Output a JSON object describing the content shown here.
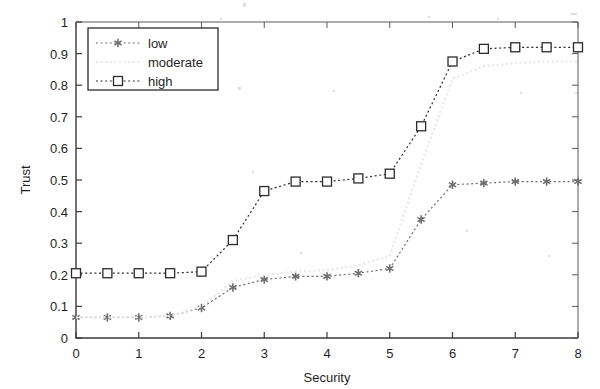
{
  "chart_data": {
    "type": "line",
    "title": "",
    "xlabel": "Security",
    "ylabel": "Trust",
    "xlim": [
      0,
      8
    ],
    "ylim": [
      0,
      1
    ],
    "xticks": [
      "0",
      "1",
      "2",
      "3",
      "4",
      "5",
      "6",
      "7",
      "8"
    ],
    "yticks": [
      "0",
      "0.1",
      "0.2",
      "0.3",
      "0.4",
      "0.5",
      "0.6",
      "0.7",
      "0.8",
      "0.9",
      "1"
    ],
    "grid": false,
    "legend_position": "upper left",
    "x": [
      0,
      0.5,
      1,
      1.5,
      2,
      2.5,
      3,
      3.5,
      4,
      4.5,
      5,
      5.5,
      6,
      6.5,
      7,
      7.5,
      8
    ],
    "series": [
      {
        "name": "low",
        "marker": "asterisk",
        "linestyle": "dotted",
        "color": "#6e6e6e",
        "values": [
          0.065,
          0.065,
          0.065,
          0.07,
          0.095,
          0.16,
          0.185,
          0.195,
          0.195,
          0.205,
          0.22,
          0.375,
          0.485,
          0.49,
          0.495,
          0.495,
          0.495
        ]
      },
      {
        "name": "moderate",
        "marker": "none",
        "linestyle": "dotted",
        "color": "#e8e8e8",
        "values": [
          0.065,
          0.065,
          0.065,
          0.07,
          0.1,
          0.18,
          0.2,
          0.21,
          0.215,
          0.23,
          0.26,
          0.55,
          0.82,
          0.86,
          0.87,
          0.875,
          0.875
        ]
      },
      {
        "name": "high",
        "marker": "square",
        "linestyle": "dotted",
        "color": "#2b2b2b",
        "values": [
          0.205,
          0.205,
          0.205,
          0.205,
          0.21,
          0.31,
          0.465,
          0.495,
          0.495,
          0.505,
          0.52,
          0.67,
          0.875,
          0.915,
          0.92,
          0.92,
          0.92
        ]
      }
    ]
  },
  "legend": {
    "entries": [
      {
        "label": "low"
      },
      {
        "label": "moderate"
      },
      {
        "label": "high"
      }
    ]
  }
}
